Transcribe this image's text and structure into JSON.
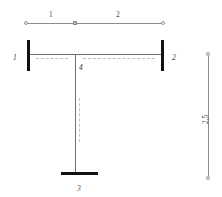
{
  "diagram": {
    "colors": {
      "support": "#111111",
      "member": "#707070",
      "dimension": "#8d8d8d",
      "centerline": "#c3bcb4",
      "label": "#3b3b3b",
      "background": "#ffffff"
    },
    "top_dimension": {
      "name": "span-dimension-line",
      "segments": [
        {
          "id": "seg-1",
          "label": "1"
        },
        {
          "id": "seg-2",
          "label": "2"
        }
      ],
      "markers": {
        "left": "circle-node",
        "middle": "square-node",
        "right": "circle-node"
      }
    },
    "right_dimension": {
      "name": "height-dimension-line",
      "label": "2,5",
      "markers": {
        "top": "circle-node",
        "bottom": "circle-node"
      }
    },
    "members": {
      "beam": {
        "name": "horizontal-beam"
      },
      "column": {
        "name": "vertical-column"
      }
    },
    "supports": [
      {
        "id": "support-left",
        "label": "1",
        "type": "fixed-vertical-plate"
      },
      {
        "id": "support-right",
        "label": "2",
        "type": "fixed-vertical-plate"
      },
      {
        "id": "support-bottom",
        "label": "3",
        "type": "fixed-horizontal-plate"
      }
    ],
    "nodes": [
      {
        "id": "node-center",
        "label": "4",
        "type": "joint"
      }
    ]
  }
}
